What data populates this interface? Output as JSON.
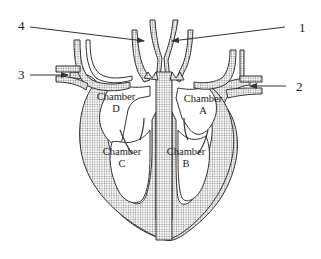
{
  "diagram": {
    "stroke_color": "#333333",
    "fill_pattern_color": "#9a9a9a",
    "background": "#ffffff",
    "labels": [
      {
        "id": "1",
        "text": "1"
      },
      {
        "id": "2",
        "text": "2"
      },
      {
        "id": "3",
        "text": "3"
      },
      {
        "id": "4",
        "text": "4"
      }
    ],
    "chambers": [
      {
        "id": "A",
        "line1": "Chamber",
        "line2": "A"
      },
      {
        "id": "B",
        "line1": "Chamber",
        "line2": "B"
      },
      {
        "id": "C",
        "line1": "Chamber",
        "line2": "C"
      },
      {
        "id": "D",
        "line1": "Chamber",
        "line2": "D"
      }
    ]
  }
}
